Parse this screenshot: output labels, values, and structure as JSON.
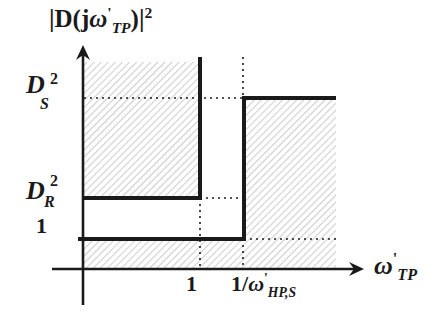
{
  "diagram": {
    "y_axis_label": {
      "prefix": "|D(j",
      "omega": "ω",
      "prime": "'",
      "sub": "TP",
      "suffix": ")|",
      "sup": "2"
    },
    "x_axis_label": {
      "omega": "ω",
      "prime": "'",
      "sub": "TP"
    },
    "y_ticks": [
      {
        "name": "DS2",
        "base": "D",
        "sup": "2",
        "sub": "S"
      },
      {
        "name": "DR2",
        "base": "D",
        "sup": "2",
        "sub": "R"
      },
      {
        "name": "one",
        "text": "1"
      }
    ],
    "x_ticks": [
      {
        "name": "one",
        "text": "1"
      },
      {
        "name": "inv-omega",
        "prefix": "1/",
        "omega": "ω",
        "prime": "'",
        "sub": "HP,S"
      }
    ],
    "colors": {
      "line": "#1a1a1a",
      "hatch": "#8a8a8a",
      "background": "#ffffff"
    }
  }
}
